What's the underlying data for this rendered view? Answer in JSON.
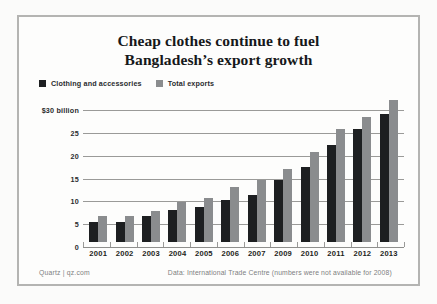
{
  "title": {
    "line1": "Cheap clothes continue to fuel",
    "line2": "Bangladesh’s export growth"
  },
  "legend": {
    "items": [
      {
        "label": "Clothing and accessories",
        "color": "#1d1f21",
        "icon": "square-swatch-icon"
      },
      {
        "label": "Total exports",
        "color": "#8a8c8e",
        "icon": "square-swatch-icon"
      }
    ]
  },
  "footer": {
    "credit": "Quartz | qz.com",
    "source": "Data: International Trade Centre (numbers were not available for 2008)"
  },
  "chart_data": {
    "type": "bar",
    "title": "Cheap clothes continue to fuel Bangladesh’s export growth",
    "xlabel": "",
    "ylabel": "",
    "ylim": [
      0,
      32
    ],
    "grid": true,
    "legend_position": "top-left",
    "ytick_labels": [
      "$30 billion",
      "25",
      "20",
      "15",
      "10",
      "5",
      "0"
    ],
    "ytick_values": [
      30,
      25,
      20,
      15,
      10,
      5,
      0
    ],
    "categories": [
      "2001",
      "2002",
      "2003",
      "2004",
      "2005",
      "2006",
      "2007",
      "2009",
      "2010",
      "2011",
      "2012",
      "2013"
    ],
    "series": [
      {
        "name": "Clothing and accessories",
        "color": "#1d1f21",
        "values": [
          4.3,
          4.4,
          5.6,
          7.0,
          7.7,
          9.3,
          10.4,
          13.5,
          16.4,
          21.3,
          24.8,
          28.1
        ]
      },
      {
        "name": "Total exports",
        "color": "#8a8c8e",
        "values": [
          5.6,
          5.6,
          6.7,
          8.7,
          9.6,
          12.1,
          13.6,
          16.0,
          19.8,
          24.8,
          27.4,
          31.2
        ]
      }
    ],
    "note": "numbers were not available for 2008"
  }
}
